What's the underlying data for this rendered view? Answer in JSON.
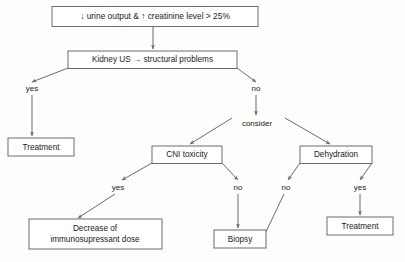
{
  "diagram": {
    "colors": {
      "background": "#fdfdfc",
      "box_stroke": "#6d6d6d",
      "box_fill": "#ffffff",
      "edge_stroke": "#6b6b6b",
      "text": "#1a1a1a"
    },
    "nodes": {
      "trigger": "↓ urine output  &  ↑ creatinine level  >  25%",
      "kidney_us": "Kidney  US  →  structural problems",
      "treatment_left": "Treatment",
      "consider": "consider",
      "cni_toxicity": "CNI toxicity",
      "dehydration": "Dehydration",
      "decrease_dose_line1": "Decrease of",
      "decrease_dose_line2": "immunosupressant  dose",
      "biopsy": "Biopsy",
      "treatment_right": "Treatment"
    },
    "branch_labels": {
      "us_yes": "yes",
      "us_no": "no",
      "cni_yes": "yes",
      "cni_no": "no",
      "dehydration_no": "no",
      "dehydration_yes": "yes"
    },
    "edges": [
      {
        "from": "trigger",
        "to": "kidney_us",
        "label": ""
      },
      {
        "from": "kidney_us",
        "to": "treatment_left",
        "label": "yes"
      },
      {
        "from": "kidney_us",
        "to": "consider",
        "label": "no"
      },
      {
        "from": "consider",
        "to": "cni_toxicity",
        "label": ""
      },
      {
        "from": "consider",
        "to": "dehydration",
        "label": ""
      },
      {
        "from": "cni_toxicity",
        "to": "decrease_dose_line1",
        "label": "yes"
      },
      {
        "from": "cni_toxicity",
        "to": "biopsy",
        "label": "no"
      },
      {
        "from": "dehydration",
        "to": "biopsy",
        "label": "no"
      },
      {
        "from": "dehydration",
        "to": "treatment_right",
        "label": "yes"
      }
    ]
  }
}
